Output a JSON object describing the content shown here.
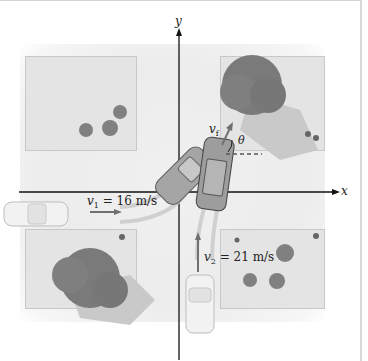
{
  "diagram": {
    "axes": {
      "x_label": "x",
      "y_label": "y"
    },
    "car1": {
      "velocity_symbol": "v",
      "velocity_subscript": "1",
      "equals": "=",
      "speed": "16 m/s"
    },
    "car2": {
      "velocity_symbol": "v",
      "velocity_subscript": "2",
      "equals": "=",
      "speed": "21 m/s"
    },
    "final": {
      "velocity_symbol": "v",
      "velocity_subscript": "f",
      "angle_symbol": "θ"
    },
    "colors": {
      "axis": "#111111",
      "block": "#e4e4e4",
      "tree": "#7a7a7a",
      "shadow": "#c4c4c4",
      "car": "#9a9a9a",
      "arrow": "#707070"
    }
  }
}
